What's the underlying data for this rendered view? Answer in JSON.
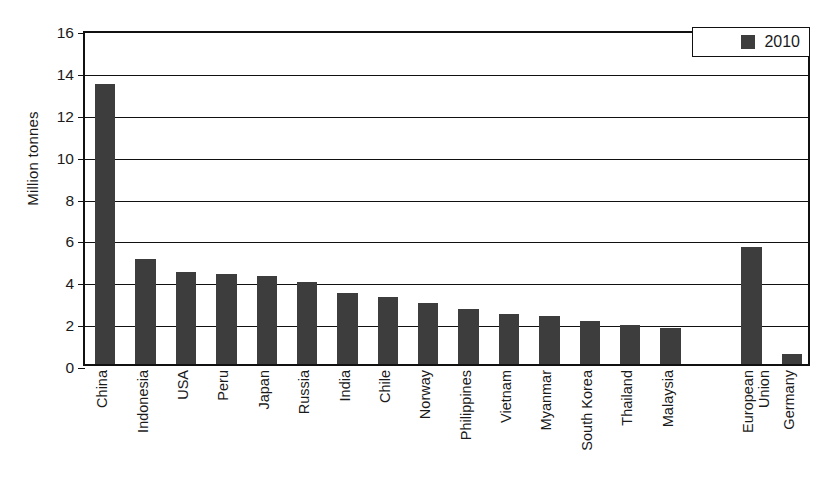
{
  "chart_data": {
    "type": "bar",
    "title": "",
    "subtitle": "",
    "xlabel": "",
    "ylabel": "Million tonnes",
    "ylim": [
      0,
      16
    ],
    "ytick_step": 2,
    "yticks": [
      0,
      2,
      4,
      6,
      8,
      10,
      12,
      14,
      16
    ],
    "grid": true,
    "legend": {
      "position": "top-right",
      "entries": [
        {
          "name": "2010",
          "color": "#3d3d3d"
        }
      ]
    },
    "series": [
      {
        "name": "2010",
        "color": "#3d3d3d",
        "values": [
          13.35,
          5.02,
          4.4,
          4.3,
          4.2,
          3.9,
          3.4,
          3.2,
          2.9,
          2.65,
          2.4,
          2.3,
          2.05,
          1.85,
          1.7,
          null,
          5.6,
          0.5
        ]
      }
    ],
    "categories": [
      "China",
      "Indonesia",
      "USA",
      "Peru",
      "Japan",
      "Russia",
      "India",
      "Chile",
      "Norway",
      "Philippines",
      "Vietnam",
      "Myanmar",
      "South Korea",
      "Thailand",
      "Malaysia",
      "",
      "European\nUnion",
      "Germany"
    ],
    "values": [
      13.35,
      5.02,
      4.4,
      4.3,
      4.2,
      3.9,
      3.4,
      3.2,
      2.9,
      2.65,
      2.4,
      2.3,
      2.05,
      1.85,
      1.7,
      null,
      5.6,
      0.5
    ]
  },
  "axes": {
    "y_title": "Million tonnes"
  },
  "legend": {
    "label": "2010"
  }
}
